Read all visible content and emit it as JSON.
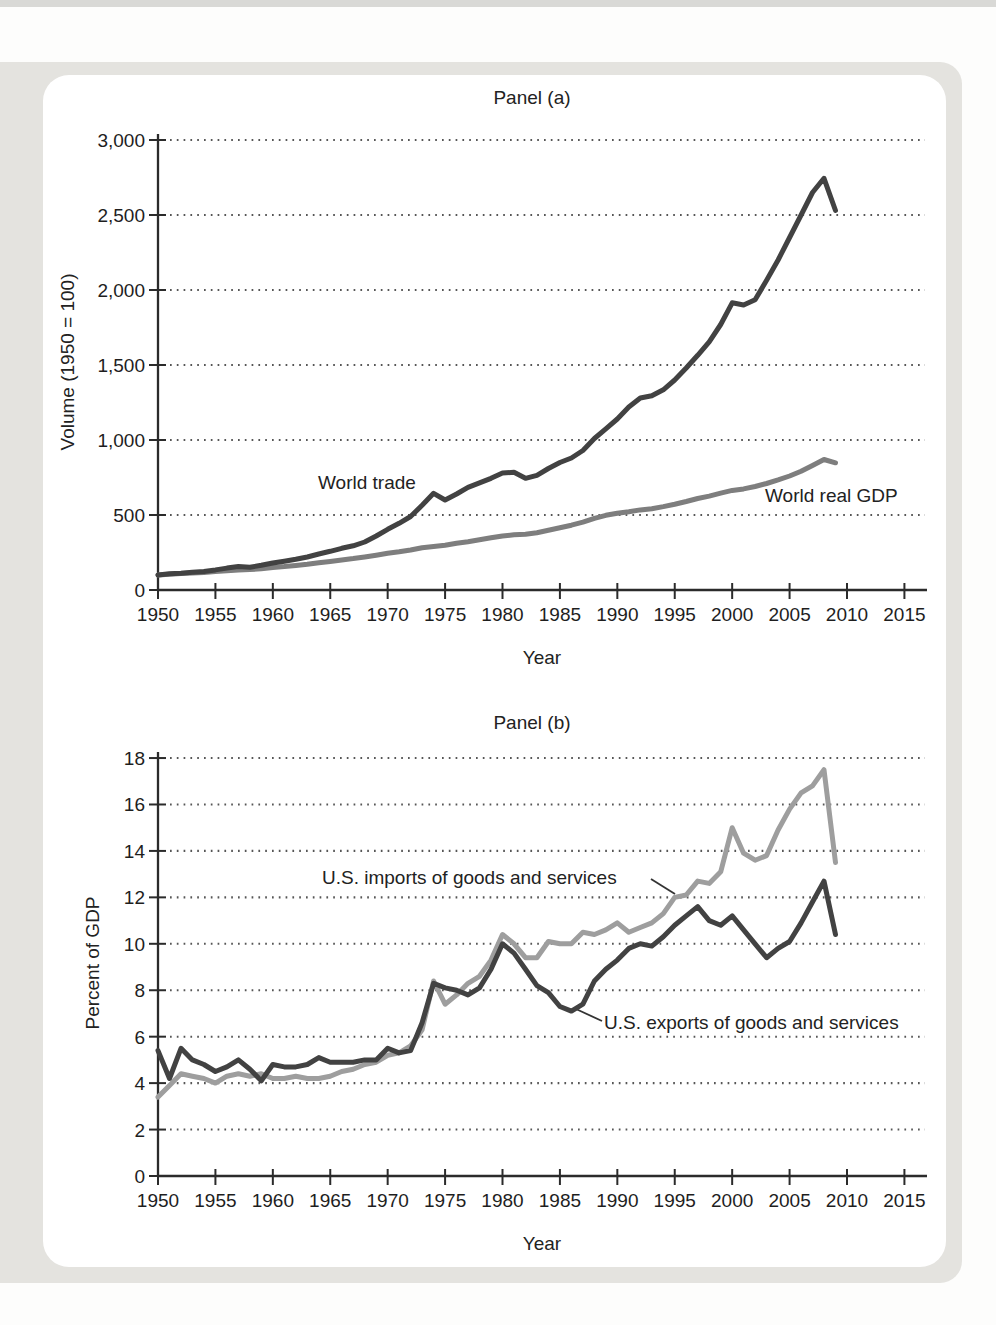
{
  "figure": {
    "panel_a": {
      "title": "Panel (a)",
      "ylabel": "Volume (1950 = 100)",
      "xlabel": "Year",
      "series_labels": {
        "world_trade": "World trade",
        "world_gdp": "World real GDP"
      }
    },
    "panel_b": {
      "title": "Panel (b)",
      "ylabel": "Percent of GDP",
      "xlabel": "Year",
      "series_labels": {
        "imports": "U.S. imports of goods and services",
        "exports": "U.S. exports of goods and services"
      }
    },
    "colors": {
      "dark_line": "#424242",
      "gdp_gray_line": "#7e7e7e",
      "imports_gray_line": "#9e9e9e",
      "frame_gray": "#e4e3df",
      "gridline_dots": "#565656"
    }
  },
  "chart_data": [
    {
      "type": "line",
      "title": "Panel (a)",
      "xlabel": "Year",
      "ylabel": "Volume (1950 = 100)",
      "xlim": [
        1950,
        2017
      ],
      "ylim": [
        0,
        3000
      ],
      "grid": "dotted horizontal gridlines at each y tick",
      "legend_position": "inline labels on chart",
      "xticks": [
        1950,
        1955,
        1960,
        1965,
        1970,
        1975,
        1980,
        1985,
        1990,
        1995,
        2000,
        2005,
        2010,
        2015
      ],
      "xtick_labels": [
        "1950",
        "1955",
        "1960",
        "1965",
        "1970",
        "1975",
        "1980",
        "1985",
        "1990",
        "1995",
        "2000",
        "2005",
        "2010",
        "2015"
      ],
      "yticks": [
        0,
        500,
        1000,
        1500,
        2000,
        2500,
        3000
      ],
      "ytick_labels": [
        "0",
        "500",
        "1,000",
        "1,500",
        "2,000",
        "2,500",
        "3,000"
      ],
      "years": [
        1950,
        1951,
        1952,
        1953,
        1954,
        1955,
        1956,
        1957,
        1958,
        1959,
        1960,
        1961,
        1962,
        1963,
        1964,
        1965,
        1966,
        1967,
        1968,
        1969,
        1970,
        1971,
        1972,
        1973,
        1974,
        1975,
        1976,
        1977,
        1978,
        1979,
        1980,
        1981,
        1982,
        1983,
        1984,
        1985,
        1986,
        1987,
        1988,
        1989,
        1990,
        1991,
        1992,
        1993,
        1994,
        1995,
        1996,
        1997,
        1998,
        1999,
        2000,
        2001,
        2002,
        2003,
        2004,
        2005,
        2006,
        2007,
        2008,
        2009
      ],
      "series": [
        {
          "name": "World real GDP",
          "color": "#7e7e7e",
          "values": [
            100,
            105,
            109,
            113,
            117,
            123,
            128,
            133,
            136,
            142,
            150,
            156,
            164,
            172,
            182,
            191,
            201,
            209,
            220,
            232,
            245,
            255,
            267,
            282,
            290,
            298,
            312,
            322,
            335,
            348,
            360,
            368,
            372,
            382,
            398,
            415,
            432,
            452,
            478,
            498,
            512,
            522,
            534,
            542,
            556,
            572,
            590,
            610,
            626,
            646,
            664,
            674,
            690,
            710,
            734,
            760,
            792,
            830,
            870,
            848
          ]
        },
        {
          "name": "World trade",
          "color": "#424242",
          "values": [
            100,
            108,
            112,
            118,
            124,
            134,
            146,
            156,
            152,
            165,
            180,
            192,
            205,
            220,
            240,
            258,
            278,
            295,
            320,
            360,
            405,
            445,
            490,
            565,
            645,
            600,
            640,
            685,
            715,
            745,
            780,
            785,
            745,
            765,
            810,
            850,
            880,
            930,
            1010,
            1075,
            1140,
            1220,
            1280,
            1295,
            1335,
            1400,
            1480,
            1565,
            1655,
            1770,
            1915,
            1900,
            1935,
            2065,
            2200,
            2350,
            2500,
            2650,
            2745,
            2530
          ]
        }
      ]
    },
    {
      "type": "line",
      "title": "Panel (b)",
      "xlabel": "Year",
      "ylabel": "Percent of GDP",
      "xlim": [
        1950,
        2017
      ],
      "ylim": [
        0,
        18
      ],
      "grid": "dotted horizontal gridlines at each y tick",
      "legend_position": "inline labels with leader lines",
      "xticks": [
        1950,
        1955,
        1960,
        1965,
        1970,
        1975,
        1980,
        1985,
        1990,
        1995,
        2000,
        2005,
        2010,
        2015
      ],
      "xtick_labels": [
        "1950",
        "1955",
        "1960",
        "1965",
        "1970",
        "1975",
        "1980",
        "1985",
        "1990",
        "1995",
        "2000",
        "2005",
        "2010",
        "2015"
      ],
      "yticks": [
        0,
        2,
        4,
        6,
        8,
        10,
        12,
        14,
        16,
        18
      ],
      "ytick_labels": [
        "0",
        "2",
        "4",
        "6",
        "8",
        "10",
        "12",
        "14",
        "16",
        "18"
      ],
      "years": [
        1950,
        1951,
        1952,
        1953,
        1954,
        1955,
        1956,
        1957,
        1958,
        1959,
        1960,
        1961,
        1962,
        1963,
        1964,
        1965,
        1966,
        1967,
        1968,
        1969,
        1970,
        1971,
        1972,
        1973,
        1974,
        1975,
        1976,
        1977,
        1978,
        1979,
        1980,
        1981,
        1982,
        1983,
        1984,
        1985,
        1986,
        1987,
        1988,
        1989,
        1990,
        1991,
        1992,
        1993,
        1994,
        1995,
        1996,
        1997,
        1998,
        1999,
        2000,
        2001,
        2002,
        2003,
        2004,
        2005,
        2006,
        2007,
        2008,
        2009
      ],
      "series": [
        {
          "name": "U.S. imports of goods and services",
          "color": "#9e9e9e",
          "values": [
            3.4,
            3.9,
            4.4,
            4.3,
            4.2,
            4.0,
            4.3,
            4.4,
            4.3,
            4.4,
            4.2,
            4.2,
            4.3,
            4.2,
            4.2,
            4.3,
            4.5,
            4.6,
            4.8,
            4.9,
            5.2,
            5.3,
            5.6,
            6.3,
            8.4,
            7.4,
            7.8,
            8.3,
            8.6,
            9.3,
            10.4,
            10.0,
            9.4,
            9.4,
            10.1,
            10.0,
            10.0,
            10.5,
            10.4,
            10.6,
            10.9,
            10.5,
            10.7,
            10.9,
            11.3,
            12.0,
            12.1,
            12.7,
            12.6,
            13.1,
            15.0,
            13.9,
            13.6,
            13.8,
            14.9,
            15.8,
            16.5,
            16.8,
            17.5,
            13.5
          ]
        },
        {
          "name": "U.S. exports of goods and services",
          "color": "#424242",
          "values": [
            5.4,
            4.2,
            5.5,
            5.0,
            4.8,
            4.5,
            4.7,
            5.0,
            4.6,
            4.1,
            4.8,
            4.7,
            4.7,
            4.8,
            5.1,
            4.9,
            4.9,
            4.9,
            5.0,
            5.0,
            5.5,
            5.3,
            5.4,
            6.6,
            8.3,
            8.1,
            8.0,
            7.8,
            8.1,
            8.9,
            10.0,
            9.6,
            8.9,
            8.2,
            7.9,
            7.3,
            7.1,
            7.4,
            8.4,
            8.9,
            9.3,
            9.8,
            10.0,
            9.9,
            10.3,
            10.8,
            11.2,
            11.6,
            11.0,
            10.8,
            11.2,
            10.6,
            10.0,
            9.4,
            9.8,
            10.1,
            10.9,
            11.8,
            12.7,
            10.4
          ]
        }
      ]
    }
  ]
}
